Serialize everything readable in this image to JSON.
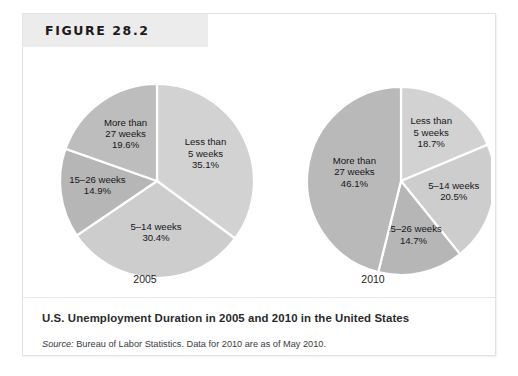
{
  "figure": {
    "banner_label": "FIGURE 28.2",
    "caption_title": "U.S. Unemployment Duration in 2005 and 2010 in the United States",
    "source_prefix": "Source:",
    "source_text": " Bureau of Labor Statistics. Data for 2010 are as of May 2010."
  },
  "colors": {
    "banner_background": "#ececec",
    "frame_border": "#e3e3e3",
    "page_background": "#ffffff",
    "slice_light": "#d2d2d2",
    "slice_medium": "#c5c5c5",
    "slice_dark": "#b0b0b0",
    "slice_darker": "#a8a8a8",
    "slice_divider": "#ffffff",
    "label_text": "#16161a",
    "caption_text": "#2a2a2e"
  },
  "chart_data": [
    {
      "type": "pie",
      "title": "2005",
      "year_label": "2005",
      "start_angle": 0,
      "direction": "clockwise",
      "categories": [
        "Less than 5 weeks",
        "5–14 weeks",
        "15–26 weeks",
        "More than 27 weeks"
      ],
      "values": [
        35.1,
        30.4,
        14.9,
        19.6
      ],
      "slices": [
        {
          "label_line1": "Less than",
          "label_line2": "5 weeks",
          "value_label": "35.1%",
          "value": 35.1,
          "color": "#d2d2d2"
        },
        {
          "label_line1": "5–14 weeks",
          "label_line2": "",
          "value_label": "30.4%",
          "value": 30.4,
          "color": "#cdcdcd"
        },
        {
          "label_line1": "15–26 weeks",
          "label_line2": "",
          "value_label": "14.9%",
          "value": 14.9,
          "color": "#b6b6b6"
        },
        {
          "label_line1": "More than",
          "label_line2": "27 weeks",
          "value_label": "19.6%",
          "value": 19.6,
          "color": "#bdbdbd"
        }
      ]
    },
    {
      "type": "pie",
      "title": "2010",
      "year_label": "2010",
      "start_angle": 0,
      "direction": "clockwise",
      "categories": [
        "Less than 5 weeks",
        "5–14 weeks",
        "15–26 weeks",
        "More than 27 weeks"
      ],
      "values": [
        18.7,
        20.5,
        14.7,
        46.1
      ],
      "slices": [
        {
          "label_line1": "Less than",
          "label_line2": "5 weeks",
          "value_label": "18.7%",
          "value": 18.7,
          "color": "#d2d2d2"
        },
        {
          "label_line1": "5–14 weeks",
          "label_line2": "",
          "value_label": "20.5%",
          "value": 20.5,
          "color": "#cdcdcd"
        },
        {
          "label_line1": "15–26 weeks",
          "label_line2": "",
          "value_label": "14.7%",
          "value": 14.7,
          "color": "#b6b6b6"
        },
        {
          "label_line1": "More than",
          "label_line2": "27 weeks",
          "value_label": "46.1%",
          "value": 46.1,
          "color": "#b9b9b9"
        }
      ]
    }
  ]
}
